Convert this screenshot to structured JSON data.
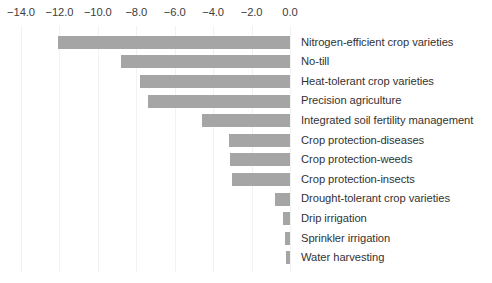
{
  "chart_data": {
    "type": "bar",
    "orientation": "horizontal",
    "title": "",
    "subtitle": "",
    "xlabel": "",
    "ylabel": "",
    "xlim": [
      -14.0,
      0.0
    ],
    "grid": true,
    "legend": false,
    "axis_position": "top",
    "bar_color": "#a5a5a5",
    "gridline_color": "#f2f2f2",
    "tick_labels": [
      "-14.0",
      "-12.0",
      "-10.0",
      "-8.0",
      "-6.0",
      "-4.0",
      "-2.0",
      "0.0"
    ],
    "ticks": [
      -14.0,
      -12.0,
      -10.0,
      -8.0,
      -6.0,
      -4.0,
      -2.0,
      0.0
    ],
    "categories": [
      "Nitrogen-efficient crop varieties",
      "No-till",
      "Heat-tolerant crop varieties",
      "Precision agriculture",
      "Integrated soil fertility management",
      "Crop protection-diseases",
      "Crop protection-weeds",
      "Crop protection-insects",
      "Drought-tolerant crop varieties",
      "Drip irrigation",
      "Sprinkler irrigation",
      "Water harvesting"
    ],
    "values": [
      -12.1,
      -8.8,
      -7.8,
      -7.4,
      -4.6,
      -3.2,
      -3.1,
      -3.0,
      -0.8,
      -0.35,
      -0.25,
      -0.2
    ]
  }
}
